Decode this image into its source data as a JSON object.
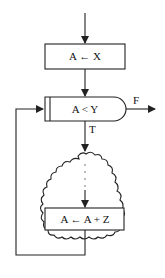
{
  "diagram": {
    "type": "flowchart",
    "nodes": [
      {
        "id": "assign1",
        "shape": "process",
        "label": "A ← X"
      },
      {
        "id": "cond",
        "shape": "decision",
        "label": "A < Y"
      },
      {
        "id": "body",
        "shape": "cloud",
        "label": "⋮"
      },
      {
        "id": "assign2",
        "shape": "process",
        "label": "A ← A + Z"
      }
    ],
    "edges": [
      {
        "from": "start",
        "to": "assign1",
        "label": ""
      },
      {
        "from": "assign1",
        "to": "cond",
        "label": ""
      },
      {
        "from": "cond",
        "to": "exit",
        "label": "F"
      },
      {
        "from": "cond",
        "to": "body",
        "label": "T"
      },
      {
        "from": "body",
        "to": "assign2",
        "label": ""
      },
      {
        "from": "assign2",
        "to": "cond",
        "label": ""
      }
    ],
    "labels": {
      "assign1": "A ← X",
      "cond": "A < Y",
      "assign2": "A ← A + Z",
      "false_branch": "F",
      "true_branch": "T"
    },
    "colors": {
      "line": "#222222",
      "background": "#ffffff"
    }
  }
}
